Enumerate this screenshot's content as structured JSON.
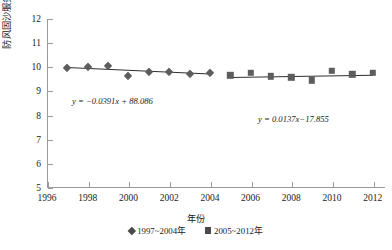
{
  "chart_data": {
    "type": "scatter",
    "title": "",
    "xlabel": "年份",
    "ylabel": "防风固沙服务量/亿t",
    "xlim": [
      1996,
      2012.6
    ],
    "ylim": [
      5,
      12
    ],
    "xticks": [
      1996,
      1998,
      2000,
      2002,
      2004,
      2006,
      2008,
      2010,
      2012
    ],
    "yticks": [
      5,
      6,
      7,
      8,
      9,
      10,
      11,
      12
    ],
    "grid": false,
    "legend_position": "bottom",
    "series": [
      {
        "name": "1997~2004年",
        "marker": "diamond",
        "color": "#5d5d5d",
        "x": [
          1997,
          1998,
          1999,
          2000,
          2001,
          2002,
          2003,
          2004
        ],
        "values": [
          9.95,
          10.02,
          10.07,
          9.65,
          9.82,
          9.79,
          9.74,
          9.78
        ],
        "trendline": {
          "equation": "y = −0.0391x + 88.086",
          "slope": -0.0391,
          "intercept": 88.086,
          "x_start": 1997,
          "x_end": 2004
        }
      },
      {
        "name": "2005~2012年",
        "marker": "square",
        "color": "#5d5d5d",
        "x": [
          2005,
          2006,
          2007,
          2008,
          2009,
          2010,
          2011,
          2012
        ],
        "values": [
          9.66,
          9.78,
          9.62,
          9.58,
          9.46,
          9.85,
          9.71,
          9.76
        ],
        "trendline": {
          "equation": "y = 0.0137x−17.855",
          "slope": 0.0137,
          "intercept": -17.855,
          "x_start": 2005,
          "x_end": 2012
        }
      }
    ],
    "annotations": [
      {
        "id": "eq1",
        "text": "y = −0.0391x + 88.086"
      },
      {
        "id": "eq2",
        "text": "y = 0.0137x−17.855"
      }
    ]
  },
  "axis": {
    "y_title": "防风固沙服务量/亿t",
    "x_title": "年份",
    "y_tick_labels": [
      "12",
      "11",
      "10",
      "9",
      "8",
      "7",
      "6",
      "5"
    ],
    "x_tick_labels": [
      "1996",
      "1998",
      "2000",
      "2002",
      "2004",
      "2006",
      "2008",
      "2010",
      "2012"
    ]
  },
  "legend": {
    "items": [
      {
        "label": "1997~2004年",
        "marker": "diamond"
      },
      {
        "label": "2005~2012年",
        "marker": "square"
      }
    ]
  },
  "caption": {
    "text": ""
  }
}
